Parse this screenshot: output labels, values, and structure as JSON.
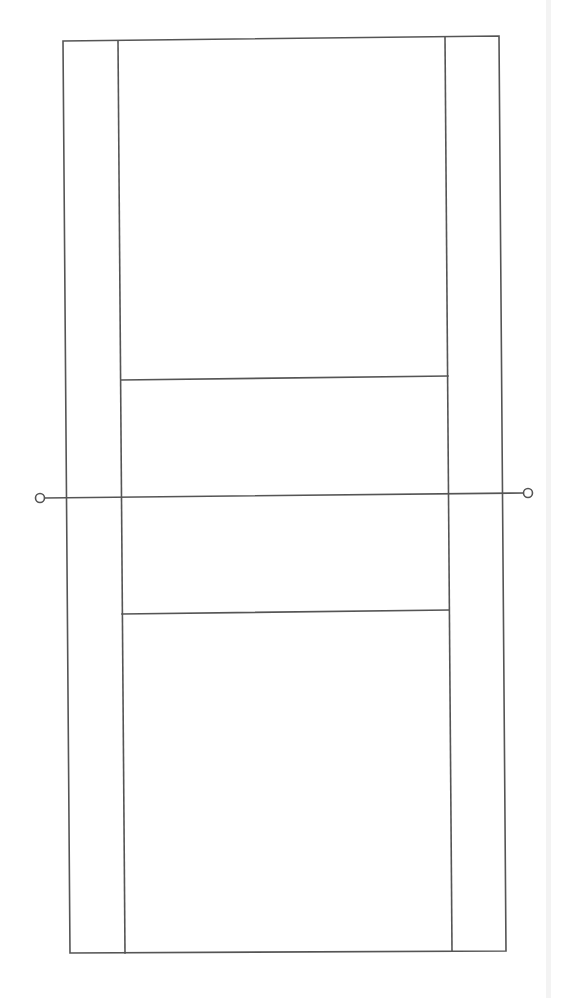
{
  "diagram": {
    "title": "",
    "elements": [
      {
        "name": "outer-boundary",
        "kind": "rectangle"
      },
      {
        "name": "left-side-line",
        "kind": "line"
      },
      {
        "name": "right-side-line",
        "kind": "line"
      },
      {
        "name": "upper-service-line",
        "kind": "line"
      },
      {
        "name": "lower-service-line",
        "kind": "line"
      },
      {
        "name": "net-line",
        "kind": "line"
      },
      {
        "name": "net-post-left",
        "kind": "circle"
      },
      {
        "name": "net-post-right",
        "kind": "circle"
      }
    ],
    "colors": {
      "line": "#555555",
      "background": "#ffffff"
    }
  }
}
